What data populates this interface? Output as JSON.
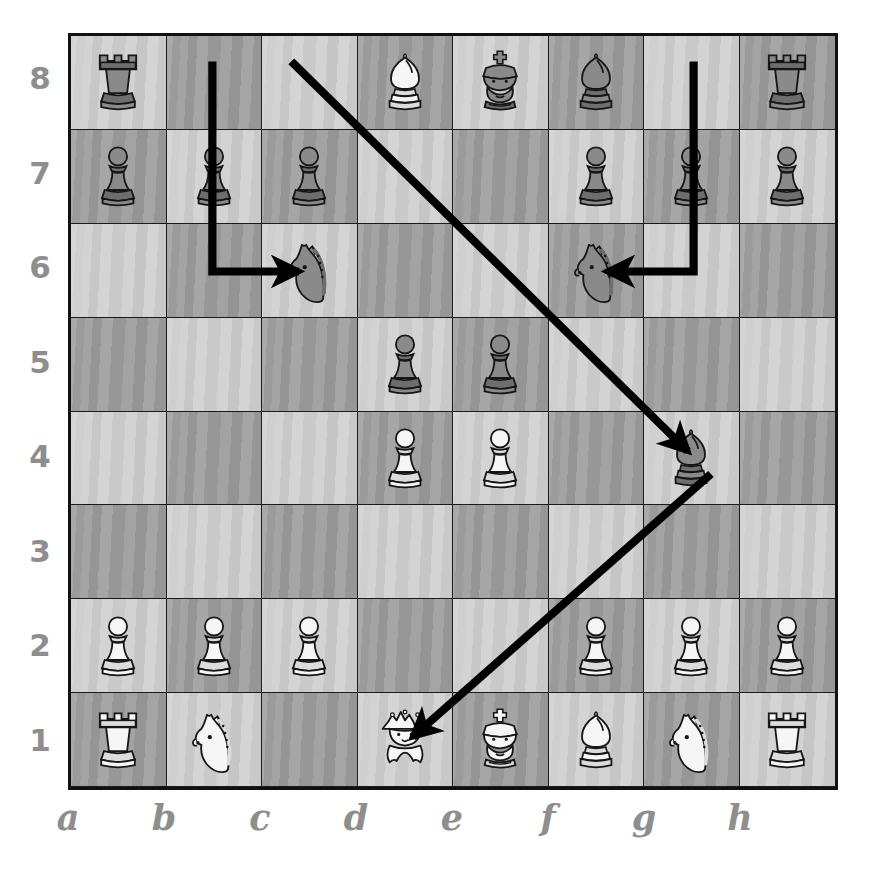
{
  "diagram": {
    "board_size": 8,
    "colors": {
      "light_square": "#cfcfcf",
      "dark_square": "#9b9b9b",
      "border": "#111111",
      "arrow": "#000000",
      "label": "#8e8e8e",
      "white_piece_fill": "#f6f6f6",
      "black_piece_fill": "#8a8a8a",
      "piece_outline": "#161616",
      "background": "#ffffff"
    }
  },
  "coordinates": {
    "files": [
      "a",
      "b",
      "c",
      "d",
      "e",
      "f",
      "g",
      "h"
    ],
    "ranks": [
      "8",
      "7",
      "6",
      "5",
      "4",
      "3",
      "2",
      "1"
    ]
  },
  "chart_data": {
    "type": "table",
    "xlabel": "files a-h",
    "ylabel": "ranks 1-8",
    "categories": [
      "a",
      "b",
      "c",
      "d",
      "e",
      "f",
      "g",
      "h"
    ],
    "ranks": [
      "8",
      "7",
      "6",
      "5",
      "4",
      "3",
      "2",
      "1"
    ],
    "legend": [
      "white pieces",
      "black pieces",
      "move arrows"
    ],
    "piece_count": {
      "white": 15,
      "black": 16
    },
    "squares": [
      [
        {
          "sq": "a8",
          "shade": "light",
          "piece": "rook",
          "color": "black"
        },
        {
          "sq": "b8",
          "shade": "dark",
          "piece": null,
          "color": null
        },
        {
          "sq": "c8",
          "shade": "light",
          "piece": null,
          "color": null
        },
        {
          "sq": "d8",
          "shade": "dark",
          "piece": "bishop",
          "color": "white"
        },
        {
          "sq": "e8",
          "shade": "light",
          "piece": "king",
          "color": "black"
        },
        {
          "sq": "f8",
          "shade": "dark",
          "piece": "bishop",
          "color": "black"
        },
        {
          "sq": "g8",
          "shade": "light",
          "piece": null,
          "color": null
        },
        {
          "sq": "h8",
          "shade": "dark",
          "piece": "rook",
          "color": "black"
        }
      ],
      [
        {
          "sq": "a7",
          "shade": "dark",
          "piece": "pawn",
          "color": "black"
        },
        {
          "sq": "b7",
          "shade": "light",
          "piece": "pawn",
          "color": "black"
        },
        {
          "sq": "c7",
          "shade": "dark",
          "piece": "pawn",
          "color": "black"
        },
        {
          "sq": "d7",
          "shade": "light",
          "piece": null,
          "color": null
        },
        {
          "sq": "e7",
          "shade": "dark",
          "piece": null,
          "color": null
        },
        {
          "sq": "f7",
          "shade": "light",
          "piece": "pawn",
          "color": "black"
        },
        {
          "sq": "g7",
          "shade": "dark",
          "piece": "pawn",
          "color": "black"
        },
        {
          "sq": "h7",
          "shade": "light",
          "piece": "pawn",
          "color": "black"
        }
      ],
      [
        {
          "sq": "a6",
          "shade": "light",
          "piece": null,
          "color": null
        },
        {
          "sq": "b6",
          "shade": "dark",
          "piece": null,
          "color": null
        },
        {
          "sq": "c6",
          "shade": "light",
          "piece": "knight",
          "color": "black"
        },
        {
          "sq": "d6",
          "shade": "dark",
          "piece": null,
          "color": null
        },
        {
          "sq": "e6",
          "shade": "light",
          "piece": null,
          "color": null
        },
        {
          "sq": "f6",
          "shade": "dark",
          "piece": "knight",
          "color": "black"
        },
        {
          "sq": "g6",
          "shade": "light",
          "piece": null,
          "color": null
        },
        {
          "sq": "h6",
          "shade": "dark",
          "piece": null,
          "color": null
        }
      ],
      [
        {
          "sq": "a5",
          "shade": "dark",
          "piece": null,
          "color": null
        },
        {
          "sq": "b5",
          "shade": "light",
          "piece": null,
          "color": null
        },
        {
          "sq": "c5",
          "shade": "dark",
          "piece": null,
          "color": null
        },
        {
          "sq": "d5",
          "shade": "light",
          "piece": "pawn",
          "color": "black"
        },
        {
          "sq": "e5",
          "shade": "dark",
          "piece": "pawn",
          "color": "black"
        },
        {
          "sq": "f5",
          "shade": "light",
          "piece": null,
          "color": null
        },
        {
          "sq": "g5",
          "shade": "dark",
          "piece": null,
          "color": null
        },
        {
          "sq": "h5",
          "shade": "light",
          "piece": null,
          "color": null
        }
      ],
      [
        {
          "sq": "a4",
          "shade": "light",
          "piece": null,
          "color": null
        },
        {
          "sq": "b4",
          "shade": "dark",
          "piece": null,
          "color": null
        },
        {
          "sq": "c4",
          "shade": "light",
          "piece": null,
          "color": null
        },
        {
          "sq": "d4",
          "shade": "dark",
          "piece": "pawn",
          "color": "white"
        },
        {
          "sq": "e4",
          "shade": "light",
          "piece": "pawn",
          "color": "white"
        },
        {
          "sq": "f4",
          "shade": "dark",
          "piece": null,
          "color": null
        },
        {
          "sq": "g4",
          "shade": "light",
          "piece": "bishop",
          "color": "black"
        },
        {
          "sq": "h4",
          "shade": "dark",
          "piece": null,
          "color": null
        }
      ],
      [
        {
          "sq": "a3",
          "shade": "dark",
          "piece": null,
          "color": null
        },
        {
          "sq": "b3",
          "shade": "light",
          "piece": null,
          "color": null
        },
        {
          "sq": "c3",
          "shade": "dark",
          "piece": null,
          "color": null
        },
        {
          "sq": "d3",
          "shade": "light",
          "piece": null,
          "color": null
        },
        {
          "sq": "e3",
          "shade": "dark",
          "piece": null,
          "color": null
        },
        {
          "sq": "f3",
          "shade": "light",
          "piece": null,
          "color": null
        },
        {
          "sq": "g3",
          "shade": "dark",
          "piece": null,
          "color": null
        },
        {
          "sq": "h3",
          "shade": "light",
          "piece": null,
          "color": null
        }
      ],
      [
        {
          "sq": "a2",
          "shade": "light",
          "piece": "pawn",
          "color": "white"
        },
        {
          "sq": "b2",
          "shade": "dark",
          "piece": "pawn",
          "color": "white"
        },
        {
          "sq": "c2",
          "shade": "light",
          "piece": "pawn",
          "color": "white"
        },
        {
          "sq": "d2",
          "shade": "dark",
          "piece": null,
          "color": null
        },
        {
          "sq": "e2",
          "shade": "light",
          "piece": null,
          "color": null
        },
        {
          "sq": "f2",
          "shade": "dark",
          "piece": "pawn",
          "color": "white"
        },
        {
          "sq": "g2",
          "shade": "light",
          "piece": "pawn",
          "color": "white"
        },
        {
          "sq": "h2",
          "shade": "dark",
          "piece": "pawn",
          "color": "white"
        }
      ],
      [
        {
          "sq": "a1",
          "shade": "dark",
          "piece": "rook",
          "color": "white"
        },
        {
          "sq": "b1",
          "shade": "light",
          "piece": "knight",
          "color": "white"
        },
        {
          "sq": "c1",
          "shade": "dark",
          "piece": null,
          "color": null
        },
        {
          "sq": "d1",
          "shade": "light",
          "piece": "queen",
          "color": "white"
        },
        {
          "sq": "e1",
          "shade": "dark",
          "piece": "king",
          "color": "white"
        },
        {
          "sq": "f1",
          "shade": "light",
          "piece": "bishop",
          "color": "white"
        },
        {
          "sq": "g1",
          "shade": "dark",
          "piece": "knight",
          "color": "white"
        },
        {
          "sq": "h1",
          "shade": "light",
          "piece": "rook",
          "color": "white"
        }
      ]
    ],
    "arrows": [
      {
        "name": "knight-b8-c6",
        "from": "b8",
        "to": "c6",
        "style": "elbow",
        "piece": "knight",
        "path": "M 1.5 0.30 V 2.52 H 2.40"
      },
      {
        "name": "knight-g8-f6",
        "from": "g8",
        "to": "f6",
        "style": "elbow",
        "piece": "knight",
        "path": "M 6.5 0.30 V 2.52 H 5.60"
      },
      {
        "name": "bishop-c8-g4",
        "from": "c8",
        "to": "g4",
        "style": "diagonal",
        "piece": "bishop",
        "path": "M 2.32 0.30 L 6.44 4.42"
      },
      {
        "name": "bishop-g4-d1",
        "from": "g4",
        "to": "d1",
        "style": "diagonal",
        "piece": "bishop",
        "path": "M 6.68 4.66 L 3.58 7.44"
      }
    ]
  }
}
